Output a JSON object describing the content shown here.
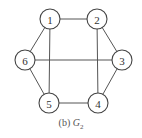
{
  "graph": {
    "name": "G2",
    "nodes": [
      {
        "id": "1",
        "label": "1",
        "x": 50,
        "y": 19
      },
      {
        "id": "2",
        "label": "2",
        "x": 97,
        "y": 19
      },
      {
        "id": "3",
        "label": "3",
        "x": 122,
        "y": 60
      },
      {
        "id": "4",
        "label": "4",
        "x": 98,
        "y": 103
      },
      {
        "id": "5",
        "label": "5",
        "x": 49,
        "y": 103
      },
      {
        "id": "6",
        "label": "6",
        "x": 25,
        "y": 60
      }
    ],
    "edges": [
      [
        "1",
        "2"
      ],
      [
        "2",
        "3"
      ],
      [
        "3",
        "4"
      ],
      [
        "4",
        "5"
      ],
      [
        "5",
        "6"
      ],
      [
        "6",
        "1"
      ],
      [
        "1",
        "5"
      ],
      [
        "2",
        "4"
      ],
      [
        "6",
        "3"
      ]
    ]
  },
  "caption": {
    "prefix": "(b) ",
    "symbol": "G",
    "subscript": "2"
  }
}
